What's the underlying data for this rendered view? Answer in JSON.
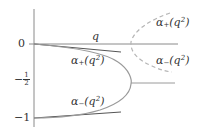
{
  "figure": {
    "type": "diagram",
    "colors": {
      "axis": "#8a8a8a",
      "dark_line": "#555555",
      "solid_curve": "#9a9a9a",
      "dashed_curve": "#b5b5b5",
      "text": "#333333"
    },
    "y_ticks": [
      {
        "label": "0",
        "value": 0
      },
      {
        "label_sign": "−",
        "label_num": "1",
        "label_den": "2",
        "value": -0.5
      },
      {
        "label": "−1",
        "value": -1
      }
    ],
    "labels": {
      "q_axis": "q",
      "alpha_plus_left_prefix": "α",
      "alpha_plus_left_sub": "+",
      "alpha_plus_left_arg": "(q",
      "alpha_plus_left_sup": "2",
      "alpha_plus_left_close": ")",
      "alpha_minus_left_prefix": "α",
      "alpha_minus_left_sub": "−",
      "alpha_minus_left_arg": "(q",
      "alpha_minus_left_sup": "2",
      "alpha_minus_left_close": ")",
      "alpha_plus_right_prefix": "α",
      "alpha_plus_right_sub": "+",
      "alpha_plus_right_arg": "(q",
      "alpha_plus_right_sup": "2",
      "alpha_plus_right_close": ")",
      "alpha_minus_right_prefix": "α",
      "alpha_minus_right_sub": "−",
      "alpha_minus_right_arg": "(q",
      "alpha_minus_right_sup": "2",
      "alpha_minus_right_close": ")"
    }
  }
}
